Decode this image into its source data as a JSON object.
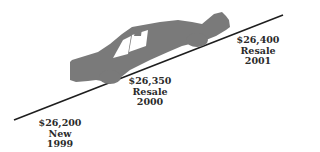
{
  "diagram": {
    "colors": {
      "car": "#7a7a7a",
      "line": "#1e1e1e",
      "text": "#2a2a2a"
    },
    "labels": [
      {
        "price": "$26,200",
        "type": "New",
        "year": "1999"
      },
      {
        "price": "$26,350",
        "type": "Resale",
        "year": "2000"
      },
      {
        "price": "$26,400",
        "type": "Resale",
        "year": "2001"
      }
    ]
  }
}
